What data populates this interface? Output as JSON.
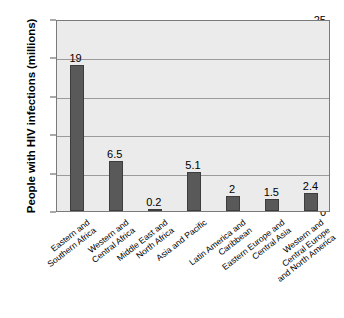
{
  "chart_data": {
    "type": "bar",
    "title": "",
    "xlabel": "",
    "ylabel": "People with HIV infections (millions)",
    "ylim": [
      0,
      25
    ],
    "yticks": [
      0,
      5,
      10,
      15,
      20,
      25
    ],
    "ytick_labels": [
      "0",
      "5",
      "10",
      "15",
      "20",
      "25"
    ],
    "grid": true,
    "legend": "none",
    "bar_color": "#595959",
    "plot_background": "#ebebeb",
    "categories": [
      "Eastern and Southern Africa",
      "Western and Central Africa",
      "Middle East and North Africa",
      "Asia and Pacific",
      "Latin America and Caribbean",
      "Eastern Europe and Central Asia",
      "Western and Central Europe and North America"
    ],
    "category_lines": [
      [
        "Eastern and",
        "Southern Africa"
      ],
      [
        "Western and",
        "Central Africa"
      ],
      [
        "Middle East and",
        "North Africa"
      ],
      [
        "Asia and Pacific"
      ],
      [
        "Latin America and",
        "Caribbean"
      ],
      [
        "Eastern Europe and",
        "Central Asia"
      ],
      [
        "Western and",
        "Central Europe",
        "and North America"
      ]
    ],
    "values": [
      19,
      6.5,
      0.2,
      5.1,
      2,
      1.5,
      2.4
    ],
    "value_labels": [
      "19",
      "6.5",
      "0.2",
      "5.1",
      "2",
      "1.5",
      "2.4"
    ]
  }
}
